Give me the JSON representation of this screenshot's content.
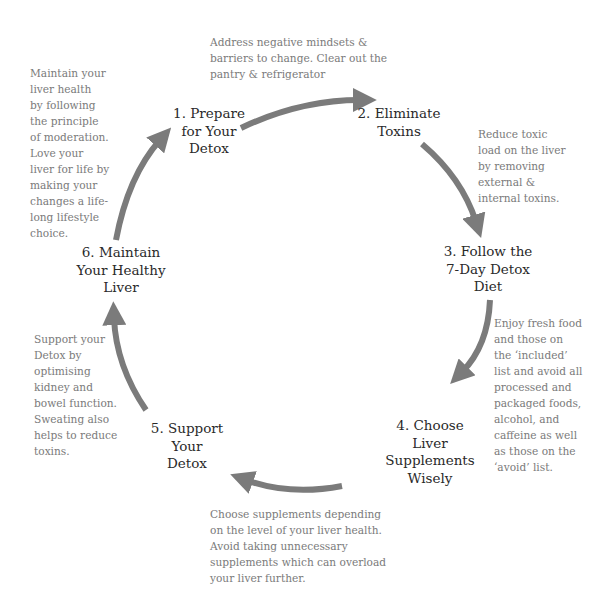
{
  "diagram": {
    "arrow_color": "#7b7b7b",
    "steps": [
      {
        "label_lines": [
          "1. Prepare",
          "for Your",
          "Detox"
        ],
        "description": "Address negative mindsets & barriers to change. Clear out the pantry & refrigerator",
        "desc_lines": [
          "Address negative mindsets &",
          "barriers to change. Clear out the",
          "pantry & refrigerator"
        ]
      },
      {
        "label_lines": [
          "2. Eliminate",
          "Toxins"
        ],
        "description": "Reduce toxic load on the liver by removing external & internal toxins.",
        "desc_lines": [
          "Reduce toxic",
          "load on the liver",
          "by removing",
          "external &",
          "internal toxins."
        ]
      },
      {
        "label_lines": [
          "3. Follow the",
          "7-Day Detox",
          "Diet"
        ],
        "description": "Enjoy fresh food and those on the 'included' list and avoid all processed and packaged foods, alcohol, and caffeine as well as those on the 'avoid' list.",
        "desc_lines": [
          "Enjoy fresh food",
          "and those on",
          "the ‘included’",
          "list and avoid all",
          "processed and",
          "packaged foods,",
          "alcohol, and",
          "caffeine as well",
          "as those on the",
          "‘avoid’ list."
        ]
      },
      {
        "label_lines": [
          "4. Choose",
          "Liver",
          "Supplements",
          "Wisely"
        ],
        "description": "Choose supplements depending on the level of your liver health. Avoid taking unnecessary supplements which can overload your liver further.",
        "desc_lines": [
          "Choose supplements depending",
          "on the level of your liver health.",
          "Avoid taking unnecessary",
          "supplements which can overload",
          "your liver further."
        ]
      },
      {
        "label_lines": [
          "5. Support",
          "Your",
          "Detox"
        ],
        "description": "Support your Detox by optimising kidney and bowel function. Sweating also helps to reduce toxins.",
        "desc_lines": [
          "Support your",
          "Detox by",
          "optimising",
          "kidney and",
          "bowel function.",
          "Sweating also",
          "helps to reduce",
          "toxins."
        ]
      },
      {
        "label_lines": [
          "6. Maintain",
          "Your Healthy",
          "Liver"
        ],
        "description": "Maintain your liver health by following the principle of moderation. Love your liver for life by making your changes a life-long lifestyle choice.",
        "desc_lines": [
          "Maintain your",
          "liver health",
          "by following",
          "the principle",
          "of moderation.",
          "Love your",
          "liver for life by",
          "making your",
          "changes a life-",
          "long lifestyle",
          "choice."
        ]
      }
    ]
  }
}
